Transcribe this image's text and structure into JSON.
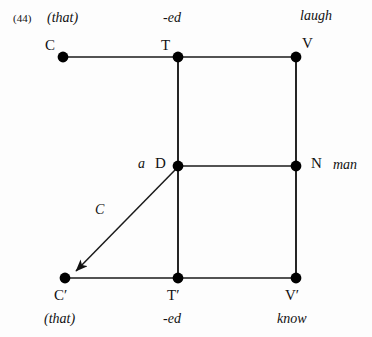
{
  "figure": {
    "example_number": "(44)",
    "background_color": "#fdfdfd",
    "line_color": "#1a1a1a",
    "node_color": "#000000",
    "width": 372,
    "height": 337
  },
  "nodes": [
    {
      "id": "C",
      "label": "C",
      "x": 63,
      "y": 57,
      "word": "(that)"
    },
    {
      "id": "T",
      "label": "T",
      "x": 178,
      "y": 57,
      "word": "-ed"
    },
    {
      "id": "V",
      "label": "V",
      "x": 296,
      "y": 57,
      "word": "laugh"
    },
    {
      "id": "D",
      "label": "D",
      "x": 178,
      "y": 166,
      "word": "a"
    },
    {
      "id": "N",
      "label": "N",
      "x": 296,
      "y": 166,
      "word": "man"
    },
    {
      "id": "Cprime",
      "label": "C′",
      "x": 65,
      "y": 278,
      "word": "(that)"
    },
    {
      "id": "Tprime",
      "label": "T′",
      "x": 178,
      "y": 278,
      "word": "-ed"
    },
    {
      "id": "Vprime",
      "label": "V′",
      "x": 296,
      "y": 278,
      "word": "know"
    }
  ],
  "labels": {
    "c_top": "C",
    "t_top": "T",
    "v_top": "V",
    "d_mid": "D",
    "n_mid": "N",
    "c_bottom": "C′",
    "t_bottom": "T′",
    "v_bottom": "V′",
    "that_top": "(that)",
    "ed_top": "-ed",
    "laugh_top": "laugh",
    "a_det": "a",
    "man_noun": "man",
    "that_bottom": "(that)",
    "ed_bottom": "-ed",
    "know_bottom": "know",
    "movement_arrow": "C"
  },
  "edges": [
    {
      "name": "c-to-t",
      "from": "C",
      "to": "T",
      "type": "line"
    },
    {
      "name": "t-to-v",
      "from": "T",
      "to": "V",
      "type": "line"
    },
    {
      "name": "t-to-d",
      "from": "T",
      "to": "D",
      "type": "line"
    },
    {
      "name": "v-to-n",
      "from": "V",
      "to": "N",
      "type": "line"
    },
    {
      "name": "d-to-n",
      "from": "D",
      "to": "N",
      "type": "line"
    },
    {
      "name": "d-to-tprime",
      "from": "D",
      "to": "Tprime",
      "type": "line"
    },
    {
      "name": "n-to-vprime",
      "from": "N",
      "to": "Vprime",
      "type": "line"
    },
    {
      "name": "cprime-to-tprime",
      "from": "Cprime",
      "to": "Tprime",
      "type": "line"
    },
    {
      "name": "tprime-to-vprime",
      "from": "Tprime",
      "to": "Vprime",
      "type": "line"
    },
    {
      "name": "d-to-cprime-movement",
      "from": "D",
      "to": "Cprime",
      "type": "arrow",
      "label": "C"
    }
  ]
}
